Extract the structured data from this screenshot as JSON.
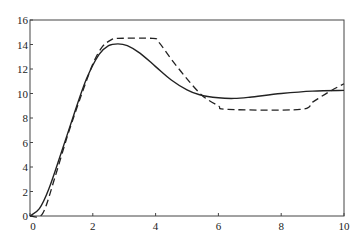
{
  "chart_data": {
    "type": "line",
    "title": "",
    "xlabel": "",
    "ylabel": "",
    "xlim": [
      0,
      10
    ],
    "ylim": [
      0,
      16
    ],
    "grid": false,
    "legend": null,
    "x_ticks": [
      0,
      2,
      4,
      6,
      8,
      10
    ],
    "y_ticks": [
      0,
      2,
      4,
      6,
      8,
      10,
      12,
      14,
      16
    ],
    "series": [
      {
        "name": "solid",
        "style": "solid",
        "x": [
          0,
          0.3,
          0.6,
          1.0,
          1.4,
          1.8,
          2.2,
          2.5,
          2.8,
          3.1,
          3.5,
          4.0,
          4.5,
          5.0,
          5.4,
          6.0,
          6.5,
          7.0,
          8.0,
          9.0,
          10.0
        ],
        "y": [
          0,
          0.6,
          2.2,
          5.2,
          8.3,
          11.2,
          13.2,
          13.9,
          14.05,
          13.9,
          13.3,
          12.2,
          11.1,
          10.3,
          9.9,
          9.65,
          9.6,
          9.7,
          10.0,
          10.2,
          10.25
        ]
      },
      {
        "name": "dashed",
        "style": "dashed",
        "x": [
          0,
          0.4,
          0.8,
          1.2,
          1.6,
          2.0,
          2.3,
          2.6,
          2.8,
          3.9,
          4.1,
          4.5,
          5.0,
          5.5,
          6.0,
          6.3,
          8.6,
          9.0,
          9.5,
          10.0
        ],
        "y": [
          0,
          0.2,
          3.2,
          6.6,
          9.6,
          12.4,
          13.8,
          14.4,
          14.5,
          14.5,
          14.2,
          12.8,
          11.2,
          9.8,
          9.0,
          8.7,
          8.7,
          9.3,
          10.1,
          10.8
        ]
      }
    ]
  },
  "axes": {
    "x_tick_labels": [
      "0",
      "2",
      "4",
      "6",
      "8",
      "10"
    ],
    "y_tick_labels": [
      "0",
      "2",
      "4",
      "6",
      "8",
      "10",
      "12",
      "14",
      "16"
    ]
  }
}
